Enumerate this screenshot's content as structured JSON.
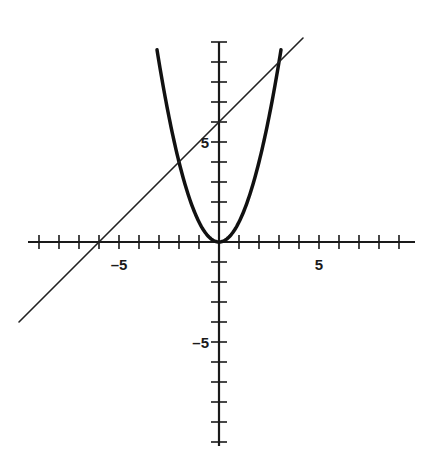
{
  "chart_data": {
    "type": "line",
    "title": "",
    "xlabel": "",
    "ylabel": "",
    "xlim": [
      -10,
      10
    ],
    "ylim": [
      -10,
      10
    ],
    "grid": false,
    "x_tick_labels": [
      {
        "value": -5,
        "label": "-5"
      },
      {
        "value": 5,
        "label": "5"
      }
    ],
    "y_tick_labels": [
      {
        "value": 5,
        "label": "5"
      },
      {
        "value": -5,
        "label": "-5"
      }
    ],
    "x_ticks": [
      -9,
      -8,
      -7,
      -6,
      -5,
      -4,
      -3,
      -2,
      -1,
      1,
      2,
      3,
      4,
      5,
      6,
      7,
      8,
      9
    ],
    "y_ticks": [
      -10,
      -9,
      -8,
      -7,
      -6,
      -5,
      -4,
      -3,
      -2,
      -1,
      1,
      2,
      3,
      4,
      5,
      6,
      7,
      8,
      9,
      10
    ],
    "series": [
      {
        "name": "parabola",
        "equation": "y = x^2",
        "x_range": [
          -3.1,
          3.1
        ],
        "stroke_width": 3.5,
        "color": "#111111"
      },
      {
        "name": "line",
        "equation": "y = x + 6",
        "x_range": [
          -10,
          4.2
        ],
        "stroke_width": 1.6,
        "color": "#222222"
      }
    ],
    "intersections": [
      {
        "x": -2,
        "y": 4
      },
      {
        "x": 3,
        "y": 9
      }
    ],
    "x_intercept_line": -6,
    "y_intercept_line": 6
  },
  "layout": {
    "origin_px": [
      219,
      242
    ],
    "unit_px": 20,
    "x_axis_px": [
      28,
      415
    ],
    "y_axis_px": [
      42,
      446
    ]
  }
}
